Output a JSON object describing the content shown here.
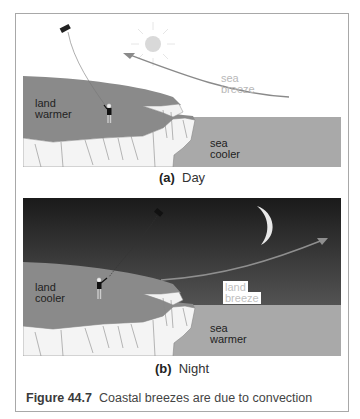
{
  "figure": {
    "number": "Figure 44.7",
    "caption": "Coastal breezes are due to convection"
  },
  "panels": [
    {
      "id": "a",
      "letter": "(a)",
      "title": "Day",
      "land_label_1": "land",
      "land_label_2": "warmer",
      "sea_label_1": "sea",
      "sea_label_2": "cooler",
      "breeze_label_1": "sea",
      "breeze_label_2": "breeze",
      "sky_icon": "sun-icon",
      "sky_color": "#ffffff",
      "land_color": "#8a8a8a",
      "sea_color": "#a9a9a9",
      "arrow_direction": "sea-to-land"
    },
    {
      "id": "b",
      "letter": "(b)",
      "title": "Night",
      "land_label_1": "land",
      "land_label_2": "cooler",
      "sea_label_1": "sea",
      "sea_label_2": "warmer",
      "breeze_label_1": "land",
      "breeze_label_2": "breeze",
      "sky_icon": "moon-icon",
      "sky_color_top": "#1a1a1a",
      "sky_color_bottom": "#6e6e6e",
      "land_color": "#8a8a8a",
      "sea_color": "#a9a9a9",
      "arrow_direction": "land-to-sea"
    }
  ]
}
